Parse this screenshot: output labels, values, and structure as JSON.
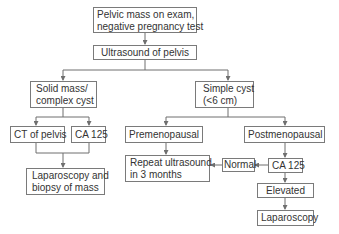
{
  "diagram": {
    "type": "flowchart",
    "nodes": {
      "start": {
        "line1": "Pelvic mass on exam,",
        "line2": "negative pregnancy test"
      },
      "ultrasound": {
        "label": "Ultrasound of pelvis"
      },
      "solid": {
        "line1": "Solid mass/",
        "line2": "complex cyst"
      },
      "simple": {
        "line1": "Simple cyst",
        "line2": "(<6 cm)"
      },
      "ct": {
        "label": "CT of pelvis"
      },
      "ca125_left": {
        "label": "CA 125"
      },
      "premeno": {
        "label": "Premenopausal"
      },
      "postmeno": {
        "label": "Postmenopausal"
      },
      "lap_biopsy": {
        "line1": "Laparoscopy and",
        "line2": "biopsy of mass"
      },
      "repeat_us": {
        "line1": "Repeat ultrasound",
        "line2": "in 3 months"
      },
      "normal": {
        "label": "Normal"
      },
      "ca125_right": {
        "label": "CA 125"
      },
      "elevated": {
        "label": "Elevated"
      },
      "laparoscopy": {
        "label": "Laparoscopy"
      }
    },
    "edges": [
      [
        "start",
        "ultrasound"
      ],
      [
        "ultrasound",
        "solid"
      ],
      [
        "ultrasound",
        "simple"
      ],
      [
        "solid",
        "ct"
      ],
      [
        "solid",
        "ca125_left"
      ],
      [
        "ct",
        "lap_biopsy"
      ],
      [
        "ca125_left",
        "lap_biopsy"
      ],
      [
        "simple",
        "premeno"
      ],
      [
        "simple",
        "postmeno"
      ],
      [
        "premeno",
        "repeat_us"
      ],
      [
        "postmeno",
        "ca125_right"
      ],
      [
        "ca125_right",
        "normal"
      ],
      [
        "normal",
        "repeat_us"
      ],
      [
        "ca125_right",
        "elevated"
      ],
      [
        "elevated",
        "laparoscopy"
      ]
    ],
    "colors": {
      "line": "#6f6f6f",
      "border": "#7a7a7a",
      "text": "#333333"
    }
  }
}
